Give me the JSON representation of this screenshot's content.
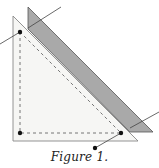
{
  "figure": {
    "caption": "Figure 1.",
    "colors": {
      "background": "#ffffff",
      "outer_triangle_fill": "#f6f6f4",
      "outer_triangle_stroke": "#888888",
      "strip_fill": "#a9a9a9",
      "strip_stroke": "#555555",
      "dashed_line": "#555555",
      "leader_line": "#444444",
      "dot": "#111111"
    },
    "elements": {
      "outer_triangle": [
        [
          13,
          16
        ],
        [
          13,
          141
        ],
        [
          138,
          141
        ]
      ],
      "gray_strip": [
        [
          28,
          7
        ],
        [
          153,
          132
        ],
        [
          130,
          132
        ],
        [
          28,
          29
        ]
      ],
      "dashed_triangle": [
        [
          20,
          32
        ],
        [
          20,
          133
        ],
        [
          121,
          133
        ]
      ],
      "dots": [
        [
          20,
          32
        ],
        [
          20,
          133
        ],
        [
          121,
          133
        ],
        [
          95,
          148
        ]
      ],
      "leader_lines": [
        [
          [
            0,
            44
          ],
          [
            20,
            32
          ]
        ],
        [
          [
            28,
            28
          ],
          [
            61,
            7
          ]
        ],
        [
          [
            130,
            128
          ],
          [
            159,
            112
          ]
        ],
        [
          [
            121,
            133
          ],
          [
            95,
            148
          ]
        ]
      ]
    }
  }
}
